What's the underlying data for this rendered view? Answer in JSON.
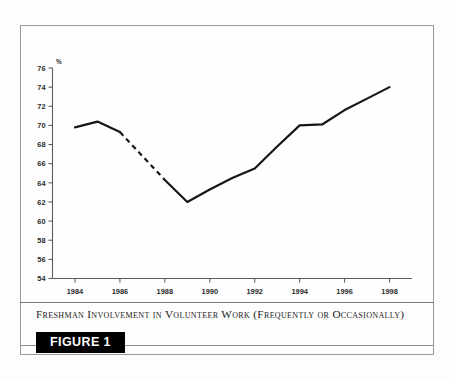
{
  "figure": {
    "badge_label": "FIGURE 1",
    "caption": "Freshman Involvement in Volunteer Work (Frequently or Occasionally)"
  },
  "colors": {
    "line": "#161616",
    "axis": "#5d5d5d",
    "frame": "#9a9a9a",
    "badge_background": "#000000",
    "badge_text": "#ffffff",
    "page_background": "#fdfdfc"
  },
  "chart_data": {
    "type": "line",
    "title": "Freshman Involvement in Volunteer Work (Frequently or Occasionally)",
    "xlabel": "",
    "ylabel": "%",
    "y_unit_label": "%",
    "xlim": [
      1983,
      1999
    ],
    "ylim": [
      54,
      76
    ],
    "y_ticks": [
      54,
      56,
      58,
      60,
      62,
      64,
      66,
      68,
      70,
      72,
      74,
      76
    ],
    "y_tick_labels": [
      "54",
      "56",
      "58",
      "60",
      "62",
      "64",
      "66",
      "68",
      "70",
      "72",
      "74",
      "76"
    ],
    "x_ticks": [
      1984,
      1986,
      1988,
      1990,
      1992,
      1994,
      1996,
      1998
    ],
    "x_tick_labels": [
      "1984",
      "1986",
      "1988",
      "1990",
      "1992",
      "1994",
      "1996",
      "1998"
    ],
    "grid": false,
    "legend": false,
    "x": [
      1984,
      1985,
      1986,
      1988,
      1989,
      1990,
      1991,
      1992,
      1993,
      1994,
      1995,
      1996,
      1997,
      1998
    ],
    "values": [
      69.8,
      70.4,
      69.3,
      64.3,
      62.0,
      63.3,
      64.5,
      65.5,
      67.8,
      70.0,
      70.1,
      71.6,
      72.8,
      74.0
    ],
    "series": [
      {
        "name": "Freshman involvement in volunteer work",
        "x": [
          1984,
          1985,
          1986,
          1988,
          1989,
          1990,
          1991,
          1992,
          1993,
          1994,
          1995,
          1996,
          1997,
          1998
        ],
        "values": [
          69.8,
          70.4,
          69.3,
          64.3,
          62.0,
          63.3,
          64.5,
          65.5,
          67.8,
          70.0,
          70.1,
          71.6,
          72.8,
          74.0
        ]
      }
    ],
    "segments": [
      {
        "style": "solid",
        "x": [
          1984,
          1985,
          1986
        ],
        "values": [
          69.8,
          70.4,
          69.3
        ]
      },
      {
        "style": "dashed",
        "x": [
          1986,
          1988
        ],
        "values": [
          69.3,
          64.3
        ],
        "note": "interpolated gap, no 1987 data"
      },
      {
        "style": "solid",
        "x": [
          1988,
          1989,
          1990,
          1991,
          1992,
          1993,
          1994,
          1995,
          1996,
          1997,
          1998
        ],
        "values": [
          64.3,
          62.0,
          63.3,
          64.5,
          65.5,
          67.8,
          70.0,
          70.1,
          71.6,
          72.8,
          74.0
        ]
      }
    ],
    "annotations": []
  }
}
